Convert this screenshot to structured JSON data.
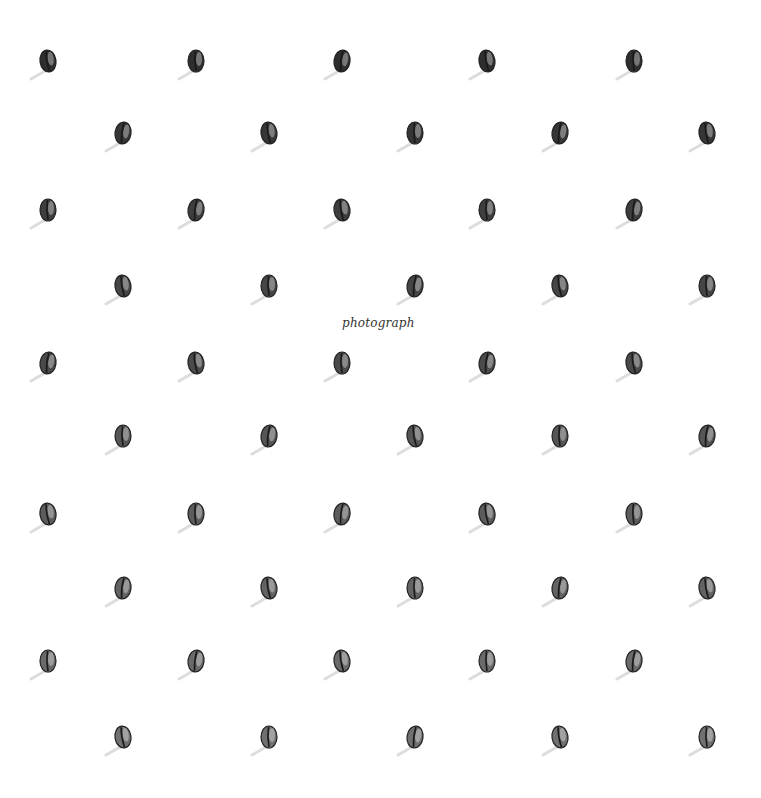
{
  "caption": "photograph",
  "rows": [
    {
      "y": 62,
      "xs": [
        48,
        196,
        342,
        487,
        634
      ],
      "shade": "#2e2e2e"
    },
    {
      "y": 134,
      "xs": [
        123,
        269,
        415,
        560,
        707
      ],
      "shade": "#363636"
    },
    {
      "y": 211,
      "xs": [
        48,
        196,
        342,
        487,
        634
      ],
      "shade": "#3e3e3e"
    },
    {
      "y": 287,
      "xs": [
        123,
        269,
        415,
        560,
        707
      ],
      "shade": "#454545"
    },
    {
      "y": 364,
      "xs": [
        48,
        196,
        342,
        487,
        634
      ],
      "shade": "#4a4a4a"
    },
    {
      "y": 437,
      "xs": [
        123,
        269,
        415,
        560,
        707
      ],
      "shade": "#555555"
    },
    {
      "y": 515,
      "xs": [
        48,
        196,
        342,
        487,
        634
      ],
      "shade": "#5c5c5c"
    },
    {
      "y": 589,
      "xs": [
        123,
        269,
        415,
        560,
        707
      ],
      "shade": "#636363"
    },
    {
      "y": 662,
      "xs": [
        48,
        196,
        342,
        487,
        634
      ],
      "shade": "#6a6a6a"
    },
    {
      "y": 738,
      "xs": [
        123,
        269,
        415,
        560,
        707
      ],
      "shade": "#707070"
    }
  ]
}
